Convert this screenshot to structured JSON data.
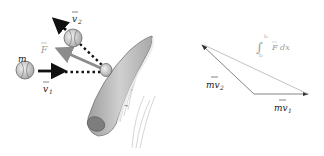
{
  "left_figure": {
    "mass_label": "m",
    "v1_label": "v",
    "v1_sub": "1",
    "v2_label": "v",
    "v2_sub": "2",
    "force_label": "F"
  },
  "right_figure": {
    "mv1_label": "mv",
    "mv1_sub": "1",
    "mv2_label": "mv",
    "mv2_sub": "2",
    "integral_upper": "t₂",
    "integral_lower": "t₁",
    "integral_body": "F dx"
  },
  "colors": {
    "arrow_dark": "#111111",
    "force_arrow": "#8c8c8c",
    "bat_fill": "#bdbdbd",
    "triangle_line": "#777777",
    "integral_text": "#9a9a9a"
  }
}
